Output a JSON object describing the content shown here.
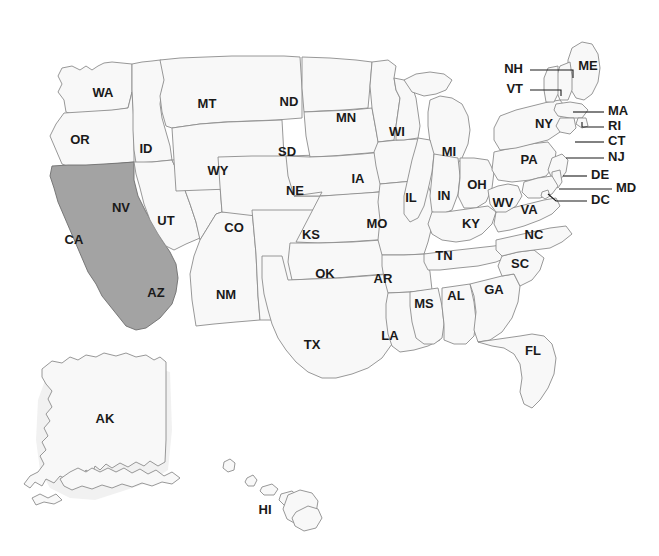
{
  "map": {
    "title": "United States Map",
    "background_color": "#ffffff",
    "state_fill_color": "#f8f8f8",
    "state_border_color": "#8c8c8c",
    "highlight_fill_color": "#a3a3a3",
    "label_color": "#1a1a1a",
    "highlighted_states": [
      "CA"
    ],
    "inline_labels": [
      {
        "code": "WA",
        "x": 103,
        "y": 94
      },
      {
        "code": "OR",
        "x": 80,
        "y": 141
      },
      {
        "code": "CA",
        "x": 74,
        "y": 241
      },
      {
        "code": "NV",
        "x": 121,
        "y": 209
      },
      {
        "code": "ID",
        "x": 146,
        "y": 150
      },
      {
        "code": "UT",
        "x": 166,
        "y": 222
      },
      {
        "code": "AZ",
        "x": 156,
        "y": 294
      },
      {
        "code": "MT",
        "x": 207,
        "y": 105
      },
      {
        "code": "WY",
        "x": 218,
        "y": 172
      },
      {
        "code": "CO",
        "x": 234,
        "y": 229
      },
      {
        "code": "NM",
        "x": 226,
        "y": 296
      },
      {
        "code": "ND",
        "x": 289,
        "y": 103
      },
      {
        "code": "SD",
        "x": 287,
        "y": 153
      },
      {
        "code": "NE",
        "x": 295,
        "y": 192
      },
      {
        "code": "KS",
        "x": 311,
        "y": 236
      },
      {
        "code": "OK",
        "x": 325,
        "y": 275
      },
      {
        "code": "TX",
        "x": 312,
        "y": 346
      },
      {
        "code": "MN",
        "x": 346,
        "y": 119
      },
      {
        "code": "IA",
        "x": 358,
        "y": 180
      },
      {
        "code": "MO",
        "x": 377,
        "y": 225
      },
      {
        "code": "AR",
        "x": 383,
        "y": 280
      },
      {
        "code": "LA",
        "x": 390,
        "y": 337
      },
      {
        "code": "WI",
        "x": 397,
        "y": 133
      },
      {
        "code": "IL",
        "x": 411,
        "y": 199
      },
      {
        "code": "IN",
        "x": 444,
        "y": 197
      },
      {
        "code": "MI",
        "x": 449,
        "y": 153
      },
      {
        "code": "OH",
        "x": 477,
        "y": 186
      },
      {
        "code": "KY",
        "x": 471,
        "y": 225
      },
      {
        "code": "TN",
        "x": 444,
        "y": 257
      },
      {
        "code": "MS",
        "x": 424,
        "y": 305
      },
      {
        "code": "AL",
        "x": 456,
        "y": 297
      },
      {
        "code": "GA",
        "x": 494,
        "y": 291
      },
      {
        "code": "FL",
        "x": 533,
        "y": 352
      },
      {
        "code": "SC",
        "x": 520,
        "y": 265
      },
      {
        "code": "NC",
        "x": 534,
        "y": 236
      },
      {
        "code": "VA",
        "x": 529,
        "y": 211
      },
      {
        "code": "WV",
        "x": 503,
        "y": 204
      },
      {
        "code": "PA",
        "x": 529,
        "y": 161
      },
      {
        "code": "NY",
        "x": 544,
        "y": 125
      },
      {
        "code": "ME",
        "x": 588,
        "y": 67
      },
      {
        "code": "AK",
        "x": 105,
        "y": 420
      },
      {
        "code": "HI",
        "x": 265,
        "y": 511
      }
    ],
    "callout_labels": [
      {
        "code": "NH",
        "label_x": 523,
        "label_y": 70,
        "anchor": "end",
        "line": "530,70 573,70 573,78"
      },
      {
        "code": "VT",
        "label_x": 523,
        "label_y": 90,
        "anchor": "end",
        "line": "530,90 561,90 561,96"
      },
      {
        "code": "MA",
        "label_x": 608,
        "label_y": 112,
        "anchor": "start",
        "line": "604,112 573,112"
      },
      {
        "code": "RI",
        "label_x": 608,
        "label_y": 127,
        "anchor": "start",
        "line": "604,127 582,127 582,122"
      },
      {
        "code": "CT",
        "label_x": 608,
        "label_y": 142,
        "anchor": "start",
        "line": "604,142 575,142"
      },
      {
        "code": "NJ",
        "label_x": 608,
        "label_y": 158,
        "anchor": "start",
        "line": "604,158 566,158"
      },
      {
        "code": "DE",
        "label_x": 591,
        "label_y": 176,
        "anchor": "start",
        "line": "587,176 563,176"
      },
      {
        "code": "MD",
        "label_x": 616,
        "label_y": 189,
        "anchor": "start",
        "line": "612,189 559,189"
      },
      {
        "code": "DC",
        "label_x": 591,
        "label_y": 201,
        "anchor": "start",
        "line": "587,201 556,201 548,194"
      }
    ]
  }
}
